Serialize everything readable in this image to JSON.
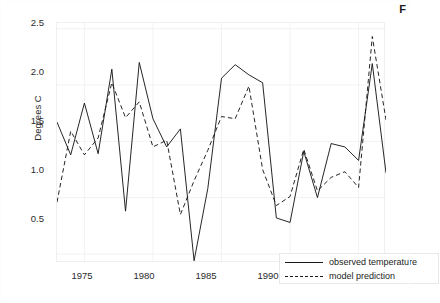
{
  "panel": {
    "label": "F"
  },
  "axes": {
    "ylabel": "Degrees C",
    "xlabel": "",
    "yticks": [
      "0.5",
      "1.0",
      "1.5",
      "2.0",
      "2.5"
    ],
    "xticks": [
      "1975",
      "1980",
      "1985",
      "1990",
      "1995"
    ]
  },
  "legend": {
    "position": "bottom-right",
    "entries": [
      {
        "label": "observed temperature",
        "style": "solid"
      },
      {
        "label": "model prediction",
        "style": "dashed"
      }
    ]
  },
  "colors": {
    "line": "#1a1a1a",
    "panel_background": "#ffffff",
    "grid": "#f2f2f2",
    "text": "#2b2b2b"
  },
  "chart_data": {
    "type": "line",
    "title": "",
    "xlabel": "",
    "ylabel": "Degrees C",
    "xlim": [
      1973,
      1997
    ],
    "ylim": [
      0.42,
      2.55
    ],
    "yticks": [
      0.5,
      1.0,
      1.5,
      2.0,
      2.5
    ],
    "xticks": [
      1975,
      1980,
      1985,
      1990,
      1995
    ],
    "grid": true,
    "legend_position": "lower right",
    "x": [
      1973,
      1974,
      1975,
      1976,
      1977,
      1978,
      1979,
      1980,
      1981,
      1982,
      1983,
      1984,
      1985,
      1986,
      1987,
      1988,
      1989,
      1990,
      1991,
      1992,
      1993,
      1994,
      1995,
      1996,
      1997
    ],
    "series": [
      {
        "name": "observed temperature",
        "style": "solid",
        "values": [
          1.67,
          1.38,
          1.84,
          1.39,
          2.14,
          0.88,
          2.2,
          1.7,
          1.45,
          1.61,
          0.44,
          1.08,
          2.06,
          2.18,
          2.09,
          2.02,
          0.82,
          0.78,
          1.41,
          1.0,
          1.48,
          1.45,
          1.33,
          2.19,
          1.22
        ]
      },
      {
        "name": "model prediction",
        "style": "dashed",
        "values": [
          0.96,
          1.59,
          1.38,
          1.53,
          2.02,
          1.71,
          1.85,
          1.45,
          1.51,
          0.85,
          1.15,
          1.42,
          1.72,
          1.7,
          1.99,
          1.25,
          0.93,
          1.01,
          1.43,
          1.06,
          1.18,
          1.23,
          1.09,
          2.43,
          1.69
        ]
      }
    ]
  }
}
